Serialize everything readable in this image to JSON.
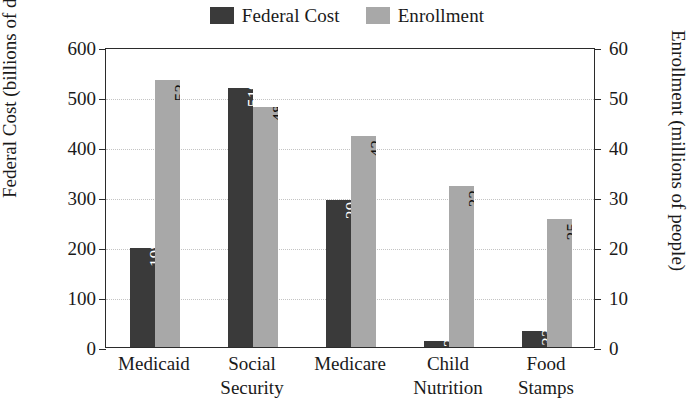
{
  "chart_data": {
    "type": "bar",
    "title": "",
    "categories": [
      "Medicaid",
      "Social Security",
      "Medicare",
      "Child Nutrition",
      "Food Stamps"
    ],
    "category_lines": [
      [
        "Medicaid"
      ],
      [
        "Social",
        "Security"
      ],
      [
        "Medicare"
      ],
      [
        "Child",
        "Nutrition"
      ],
      [
        "Food",
        "Stamps"
      ]
    ],
    "series": [
      {
        "name": "Federal Cost",
        "axis": "left",
        "color": "#3a3a3a",
        "label_color": "#ffffff",
        "values": [
          198,
          519,
          294,
          12,
          33
        ],
        "value_labels": [
          "198",
          "519",
          "294",
          "12",
          "33"
        ]
      },
      {
        "name": "Enrollment",
        "axis": "right",
        "color": "#a8a8a8",
        "label_color": "#111111",
        "values": [
          53.4,
          48,
          42.3,
          32.3,
          25.7
        ],
        "value_labels": [
          "53.4",
          "48",
          "42.3",
          "32.3",
          "25.7"
        ]
      }
    ],
    "left_axis": {
      "label": "Federal Cost (billions of dollars)",
      "ticks": [
        0,
        100,
        200,
        300,
        400,
        500,
        600
      ],
      "tick_labels": [
        "0",
        "100",
        "200",
        "300",
        "400",
        "500",
        "600"
      ],
      "min": 0,
      "max": 600
    },
    "right_axis": {
      "label": "Enrollment (millions of people)",
      "ticks": [
        0,
        10,
        20,
        30,
        40,
        50,
        60
      ],
      "tick_labels": [
        "0",
        "10",
        "20",
        "30",
        "40",
        "50",
        "60"
      ],
      "min": 0,
      "max": 60
    },
    "xlabel": "",
    "grid": true,
    "grid_style": "dotted-horizontal",
    "legend": {
      "position": "top-center",
      "entries": [
        {
          "label": "Federal Cost",
          "color": "#3a3a3a"
        },
        {
          "label": "Enrollment",
          "color": "#a8a8a8"
        }
      ]
    },
    "value_label_orientation": "vertical-inside-bar",
    "background": "#ffffff",
    "frame_color": "#2b2b2b"
  }
}
